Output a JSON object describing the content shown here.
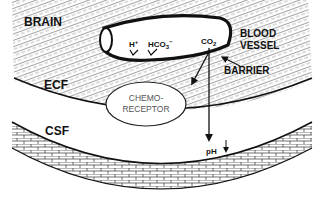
{
  "diagram": {
    "type": "anatomical-schematic",
    "regions": {
      "brain": "BRAIN",
      "ecf": "ECF",
      "csf": "CSF"
    },
    "vessel": {
      "label_line1": "BLOOD",
      "label_line2": "VESSEL",
      "ions": {
        "h_plus": "H",
        "h_plus_sup": "+",
        "bicarbonate": "HCO",
        "bicarbonate_sub": "3",
        "bicarbonate_sup": "−",
        "co2": "CO",
        "co2_sub": "2"
      }
    },
    "barrier": {
      "label": "BARRIER"
    },
    "chemoreceptor": {
      "label_line1": "CHEMO-",
      "label_line2": "RECEPTOR"
    },
    "ph_indicator": {
      "label": "pH",
      "direction": "↓"
    },
    "colors": {
      "ink": "#111111",
      "background": "#ffffff",
      "hatch": "#6a6a6a",
      "receptor_text": "#666666"
    }
  }
}
